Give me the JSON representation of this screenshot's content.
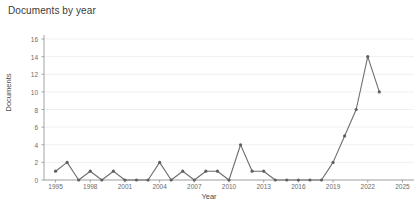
{
  "chart_data": {
    "type": "line",
    "title": "Documents by year",
    "xlabel": "Year",
    "ylabel": "Documents",
    "x": [
      1995,
      1996,
      1997,
      1998,
      1999,
      2000,
      2001,
      2002,
      2003,
      2004,
      2005,
      2006,
      2007,
      2008,
      2009,
      2010,
      2011,
      2012,
      2013,
      2014,
      2015,
      2016,
      2017,
      2018,
      2019,
      2020,
      2021,
      2022,
      2023
    ],
    "values": [
      1,
      2,
      0,
      1,
      0,
      1,
      0,
      0,
      0,
      2,
      0,
      1,
      0,
      1,
      1,
      0,
      4,
      1,
      1,
      0,
      0,
      0,
      0,
      0,
      2,
      5,
      8,
      14,
      10
    ],
    "xlim": [
      1994,
      2026
    ],
    "ylim": [
      0,
      16
    ],
    "yticks": [
      0,
      2,
      4,
      6,
      8,
      10,
      12,
      14,
      16
    ],
    "xticks": [
      1995,
      1998,
      2001,
      2004,
      2007,
      2010,
      2013,
      2016,
      2019,
      2022,
      2025
    ],
    "grid": true,
    "legend": "none",
    "line_color": "#6e6e6e",
    "marker_color": "#5f5f5f",
    "grid_color": "#ececec",
    "axis_color": "#9a9a9a",
    "background": "#ffffff"
  }
}
